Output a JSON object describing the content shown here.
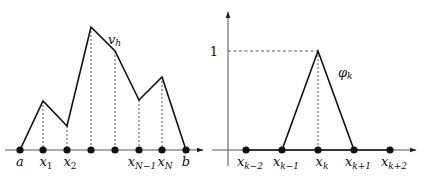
{
  "left_panel": {
    "function_label": "v",
    "function_label_sub": "h",
    "axis": {
      "y": 150,
      "x_start": 5,
      "x_end": 203
    },
    "points": [
      {
        "x": 20,
        "y": 150,
        "label": "a",
        "sub": ""
      },
      {
        "x": 43,
        "y": 101,
        "label": "x",
        "sub": "1"
      },
      {
        "x": 67,
        "y": 126,
        "label": "x",
        "sub": "2"
      },
      {
        "x": 91,
        "y": 27,
        "label": "",
        "sub": ""
      },
      {
        "x": 115,
        "y": 51,
        "label": "",
        "sub": ""
      },
      {
        "x": 139,
        "y": 100,
        "label": "x",
        "sub": "N−1"
      },
      {
        "x": 162,
        "y": 77,
        "label": "x",
        "sub": "N"
      },
      {
        "x": 186,
        "y": 150,
        "label": "b",
        "sub": ""
      }
    ]
  },
  "right_panel": {
    "function_label": "φ",
    "function_label_sub": "k",
    "y_tick_label": "1",
    "y_axis": {
      "x": 228,
      "y_top": 12,
      "y_bottom": 166
    },
    "x_axis": {
      "y": 150,
      "x_start": 212,
      "x_end": 416
    },
    "peak": {
      "x": 318,
      "y": 51
    },
    "nodes": [
      {
        "x": 246,
        "label": "x",
        "sub": "k−2"
      },
      {
        "x": 282,
        "label": "x",
        "sub": "k−1"
      },
      {
        "x": 318,
        "label": "x",
        "sub": "k"
      },
      {
        "x": 354,
        "label": "x",
        "sub": "k+1"
      },
      {
        "x": 390,
        "label": "x",
        "sub": "k+2"
      }
    ]
  }
}
